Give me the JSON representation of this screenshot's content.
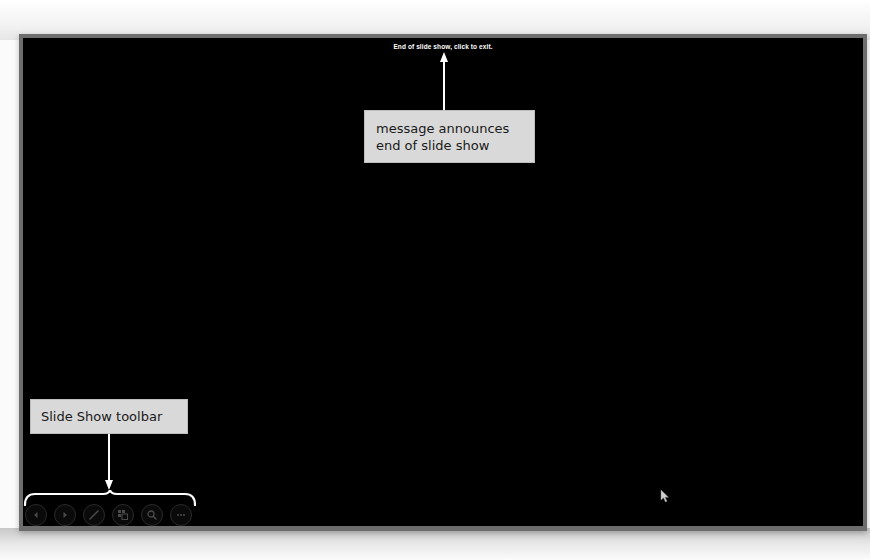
{
  "slideshow": {
    "end_message": "End of slide show, click to exit.",
    "background_color": "#000000",
    "frame_color": "#6d6d6d"
  },
  "callouts": {
    "end_message": {
      "line1": "message announces",
      "line2": "end of slide show"
    },
    "toolbar": {
      "label": "Slide Show toolbar"
    }
  },
  "toolbar": {
    "buttons": [
      {
        "name": "previous",
        "icon": "chevron-left-icon"
      },
      {
        "name": "next",
        "icon": "chevron-right-icon"
      },
      {
        "name": "pen",
        "icon": "pen-icon"
      },
      {
        "name": "see-all-slides",
        "icon": "slides-grid-icon"
      },
      {
        "name": "zoom",
        "icon": "magnifier-icon"
      },
      {
        "name": "more-options",
        "icon": "ellipsis-icon"
      }
    ]
  },
  "colors": {
    "callout_fill": "#d9d9d9",
    "callout_text": "#1a1a1a",
    "arrow": "#ffffff",
    "toolbar_icon": "#4a4a4a"
  }
}
